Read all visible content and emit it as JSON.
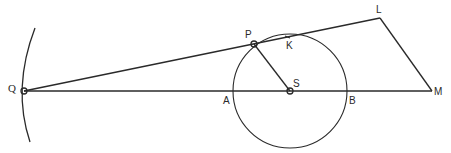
{
  "diagram": {
    "type": "geometric-construction",
    "colors": {
      "ink": "#2a2a2a",
      "background": "#ffffff"
    },
    "points": {
      "Q": {
        "label": "Q",
        "x": 24,
        "y": 91
      },
      "P": {
        "label": "P",
        "x": 254,
        "y": 44
      },
      "K": {
        "label": "K",
        "x": 288,
        "y": 37
      },
      "S": {
        "label": "S",
        "x": 290,
        "y": 91
      },
      "A": {
        "label": "A",
        "x": 233,
        "y": 91
      },
      "B": {
        "label": "B",
        "x": 347,
        "y": 91
      },
      "L": {
        "label": "L",
        "x": 380,
        "y": 18
      },
      "M": {
        "label": "M",
        "x": 432,
        "y": 91
      }
    },
    "circle": {
      "center": "S",
      "radius": 57
    },
    "segments": [
      {
        "from": "Q",
        "to": "M"
      },
      {
        "from": "Q",
        "to": "L"
      },
      {
        "from": "L",
        "to": "M"
      },
      {
        "from": "P",
        "to": "S"
      }
    ],
    "arc": {
      "description": "arc through Q",
      "top": [
        35,
        28
      ],
      "bottom": [
        30,
        142
      ]
    }
  }
}
